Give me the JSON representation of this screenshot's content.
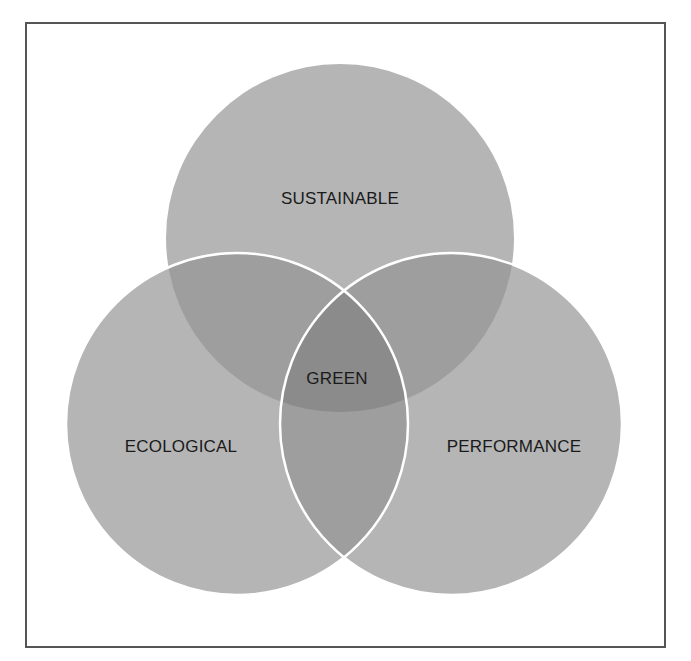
{
  "diagram": {
    "type": "venn",
    "colors": {
      "background": "#ffffff",
      "frame": "#555555",
      "single": "#b5b5b5",
      "double": "#9e9e9e",
      "triple": "#8b8b8b",
      "outline": "#ffffff",
      "text": "#1a1a1a"
    },
    "circles": [
      {
        "id": "top",
        "label": "SUSTAINABLE",
        "cx": 340,
        "cy": 238,
        "r": 174
      },
      {
        "id": "left",
        "label": "ECOLOGICAL",
        "cx": 237,
        "cy": 424,
        "r": 171
      },
      {
        "id": "right",
        "label": "PERFORMANCE",
        "cx": 451,
        "cy": 424,
        "r": 171
      }
    ],
    "labels": {
      "top": "SUSTAINABLE",
      "left": "ECOLOGICAL",
      "right": "PERFORMANCE",
      "center": "GREEN"
    }
  }
}
